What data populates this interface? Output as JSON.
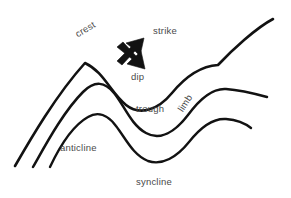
{
  "figure": {
    "name": "fold-structure-diagram",
    "background_color": "#ffffff",
    "line_color": "#121212",
    "label_color": "#4a4a4a"
  },
  "labels": {
    "crest": "crest",
    "strike": "strike",
    "dip": "dip",
    "trough": "trough",
    "limb": "limb",
    "anticline": "anticline",
    "syncline": "syncline"
  },
  "arrows": [
    {
      "name": "strike-arrow",
      "direction": "up-right"
    },
    {
      "name": "dip-arrow",
      "direction": "down-right"
    }
  ],
  "beds": [
    {
      "name": "upper-bed"
    },
    {
      "name": "middle-bed"
    },
    {
      "name": "lower-bed"
    }
  ]
}
